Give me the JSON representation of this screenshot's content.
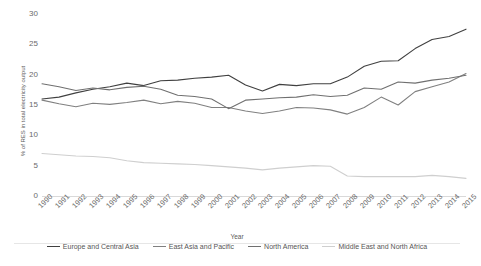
{
  "chart_data": {
    "type": "line",
    "title": "",
    "xlabel": "Year",
    "ylabel": "% of RES in total electricity output",
    "xlim": [
      1990,
      2015
    ],
    "ylim": [
      0,
      30
    ],
    "yticks": [
      0,
      5,
      10,
      15,
      20,
      25,
      30
    ],
    "grid": false,
    "legend_position": "bottom",
    "x": [
      1990,
      1991,
      1992,
      1993,
      1994,
      1995,
      1996,
      1997,
      1998,
      1999,
      2000,
      2001,
      2002,
      2003,
      2004,
      2005,
      2006,
      2007,
      2008,
      2009,
      2010,
      2011,
      2012,
      2013,
      2014,
      2015
    ],
    "series": [
      {
        "name": "Europe and Central Asia",
        "color": "#404040",
        "values": [
          16.0,
          16.3,
          17.0,
          17.6,
          18.0,
          18.6,
          18.2,
          19.0,
          19.1,
          19.4,
          19.6,
          19.9,
          18.3,
          17.3,
          18.4,
          18.2,
          18.5,
          18.5,
          19.6,
          21.4,
          22.2,
          22.3,
          24.3,
          25.8,
          26.3,
          27.5
        ]
      },
      {
        "name": "East Asia and Pacific",
        "color": "#808080",
        "values": [
          15.8,
          15.2,
          14.7,
          15.3,
          15.1,
          15.4,
          15.8,
          15.2,
          15.6,
          15.3,
          14.6,
          14.6,
          14.0,
          13.6,
          14.0,
          14.6,
          14.5,
          14.2,
          13.5,
          14.6,
          16.3,
          15.0,
          17.2,
          18.0,
          18.8,
          20.2
        ]
      },
      {
        "name": "North America",
        "color": "#707070",
        "values": [
          18.5,
          18.0,
          17.4,
          17.8,
          17.5,
          17.9,
          18.1,
          17.6,
          16.6,
          16.4,
          16.0,
          14.4,
          15.8,
          16.0,
          16.2,
          16.3,
          16.7,
          16.4,
          16.6,
          17.8,
          17.6,
          18.8,
          18.6,
          19.1,
          19.4,
          19.9
        ]
      },
      {
        "name": "Middle East and North Africa",
        "color": "#cfcfcf",
        "values": [
          7.0,
          6.8,
          6.6,
          6.5,
          6.3,
          5.8,
          5.5,
          5.4,
          5.3,
          5.2,
          5.0,
          4.8,
          4.6,
          4.3,
          4.6,
          4.8,
          5.0,
          4.9,
          3.3,
          3.2,
          3.2,
          3.2,
          3.2,
          3.4,
          3.2,
          2.9
        ]
      }
    ]
  }
}
